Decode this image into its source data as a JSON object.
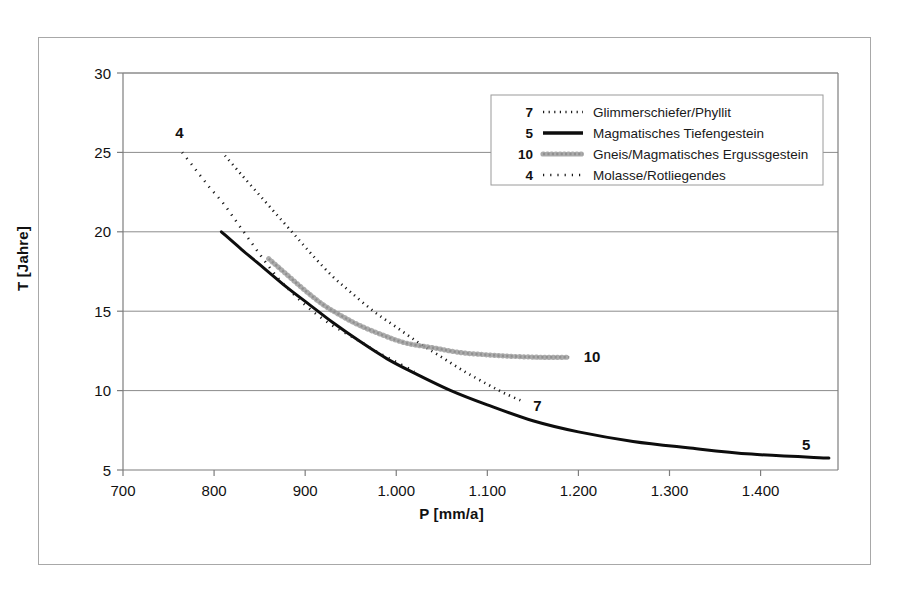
{
  "figure": {
    "background_color": "#ffffff",
    "frame_color": "#a8a8a8",
    "plot_axis_color": "#7d7d7d",
    "gridline_color": "#8c8c8c"
  },
  "chart_data": {
    "type": "line",
    "title": "",
    "xlabel": "P [mm/a]",
    "ylabel": "T [Jahre]",
    "xlim": [
      700,
      1485
    ],
    "ylim": [
      5,
      30
    ],
    "xticks": [
      700,
      800,
      900,
      1000,
      1100,
      1200,
      1300,
      1400
    ],
    "xticklabels": [
      "700",
      "800",
      "900",
      "1.000",
      "1.100",
      "1.200",
      "1.300",
      "1.400"
    ],
    "yticks": [
      5,
      10,
      15,
      20,
      25,
      30
    ],
    "yticklabels": [
      "5",
      "10",
      "15",
      "20",
      "25",
      "30"
    ],
    "grid": "horizontal",
    "legend_position": "upper-right-inside",
    "series": [
      {
        "key": "7",
        "number": "7",
        "name": "Glimmerschiefer/Phyllit",
        "style": "dotted",
        "color": "#1a1a1a",
        "width": 2.6,
        "dasharray": "1.2 4.4",
        "end_tag": "7",
        "end_tag_xy": [
          1155,
          9.0
        ],
        "x": [
          812,
          830,
          850,
          870,
          890,
          910,
          930,
          950,
          975,
          1000,
          1025,
          1050,
          1075,
          1100,
          1120,
          1140
        ],
        "y": [
          24.8,
          23.6,
          22.3,
          21.0,
          19.7,
          18.4,
          17.2,
          16.2,
          15.0,
          14.0,
          13.0,
          12.1,
          11.2,
          10.4,
          9.8,
          9.3
        ]
      },
      {
        "key": "5",
        "number": "5",
        "name": "Magmatisches Tiefengestein",
        "style": "solid",
        "color": "#0d0d0d",
        "width": 3.0,
        "dasharray": "",
        "end_tag": "5",
        "end_tag_xy": [
          1450,
          6.6
        ],
        "x": [
          808,
          830,
          855,
          880,
          905,
          930,
          960,
          990,
          1020,
          1060,
          1100,
          1150,
          1200,
          1260,
          1320,
          1390,
          1475
        ],
        "y": [
          20.0,
          18.9,
          17.7,
          16.5,
          15.4,
          14.3,
          13.1,
          12.0,
          11.1,
          10.0,
          9.1,
          8.1,
          7.4,
          6.8,
          6.4,
          6.0,
          5.75
        ]
      },
      {
        "key": "10",
        "number": "10",
        "name": "Gneis/Magmatisches Ergussgestein",
        "style": "chain-circles",
        "color": "#909090",
        "width": 2.4,
        "dasharray": "2.2 2.2",
        "end_tag": "10",
        "end_tag_xy": [
          1215,
          12.1
        ],
        "x": [
          860,
          880,
          900,
          920,
          940,
          960,
          985,
          1010,
          1040,
          1070,
          1100,
          1130,
          1160,
          1190
        ],
        "y": [
          18.3,
          17.3,
          16.3,
          15.4,
          14.7,
          14.1,
          13.5,
          13.0,
          12.7,
          12.4,
          12.25,
          12.15,
          12.1,
          12.1
        ]
      },
      {
        "key": "4",
        "number": "4",
        "name": "Molasse/Rotliegendes",
        "style": "dotted-sparse",
        "color": "#1a1a1a",
        "width": 2.6,
        "dasharray": "1.2 6.0",
        "end_tag": "4",
        "end_tag_xy": [
          762,
          26.2
        ],
        "x": [
          765,
          780,
          795,
          810,
          825,
          840,
          855,
          870,
          885,
          900,
          915,
          930,
          945,
          960,
          980,
          1000,
          1020
        ],
        "y": [
          25.0,
          23.9,
          22.8,
          21.8,
          20.6,
          19.4,
          18.2,
          17.1,
          16.2,
          15.4,
          14.7,
          14.1,
          13.6,
          13.1,
          12.4,
          11.8,
          11.2
        ]
      }
    ]
  },
  "legend": {
    "entries": [
      {
        "number": "7",
        "label": "Glimmerschiefer/Phyllit"
      },
      {
        "number": "5",
        "label": "Magmatisches Tiefengestein"
      },
      {
        "number": "10",
        "label": "Gneis/Magmatisches Ergussgestein"
      },
      {
        "number": "4",
        "label": "Molasse/Rotliegendes"
      }
    ]
  }
}
